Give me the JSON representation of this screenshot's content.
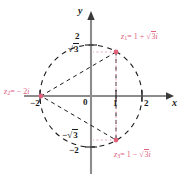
{
  "figure": {
    "type": "argand-diagram",
    "title": "",
    "axes": {
      "x_label": "x",
      "y_label": "y",
      "origin_label": "0",
      "x_ticks": [
        "-2",
        "1",
        "2"
      ],
      "y_ticks": [
        "2",
        "√3",
        "-√3",
        "-2"
      ]
    },
    "circle": {
      "radius_units": 2,
      "style": "dashed",
      "color": "#1a1a1a"
    },
    "points": [
      {
        "id": "z1",
        "label": "z₁ = 1 + √3i",
        "x": 1,
        "y": 1.732,
        "color": "#e0607e"
      },
      {
        "id": "z2",
        "label": "z₂ = −2i",
        "x": -2,
        "y": 0,
        "color": "#e0607e"
      },
      {
        "id": "z3",
        "label": "z₃ = 1 − √3i",
        "x": 1,
        "y": -1.732,
        "color": "#e0607e"
      }
    ],
    "labels": {
      "z1_prefix": "z",
      "z1_sub": "1",
      "z1_body": "= 1 + ",
      "z1_rad": "3",
      "z1_i": "i",
      "z2_prefix": "z",
      "z2_sub": "2",
      "z2_body": "= − 2",
      "z2_i": "i",
      "z3_prefix": "z",
      "z3_sub": "3",
      "z3_body": "= 1 − ",
      "z3_rad": "3",
      "z3_i": "i",
      "tick_2_top": "2",
      "tick_sqrt3_top": "3",
      "tick_sqrt3_bot": "3",
      "tick_2_bot": "2",
      "tick_minus2_x": "−2",
      "tick_1_x": "1",
      "tick_2_x": "2",
      "origin": "0",
      "axis_x": "x",
      "axis_y": "y"
    }
  },
  "chart_data": {
    "type": "scatter",
    "xlabel": "x",
    "ylabel": "y",
    "xlim": [
      -2.6,
      2.6
    ],
    "ylim": [
      -2.6,
      2.6
    ],
    "grid": false,
    "legend": "none",
    "x_ticks": [
      -2,
      0,
      1,
      2
    ],
    "x_ticklabels": [
      "-2",
      "0",
      "1",
      "2"
    ],
    "y_ticks": [
      -2,
      -1.732,
      1.732,
      2
    ],
    "y_ticklabels": [
      "-2",
      "-√3",
      "√3",
      "2"
    ],
    "series": [
      {
        "name": "roots",
        "color": "#e0607e",
        "points": [
          {
            "label": "z1",
            "x": 1,
            "y": 1.732,
            "annotation": "z₁ = 1 + √3i"
          },
          {
            "label": "z2",
            "x": -2,
            "y": 0,
            "annotation": "z₂ = −2i"
          },
          {
            "label": "z3",
            "x": 1,
            "y": -1.732,
            "annotation": "z₃ = 1 − √3i"
          }
        ]
      }
    ],
    "annotations": [
      {
        "kind": "circle",
        "center": [
          0,
          0
        ],
        "radius": 2,
        "style": "dashed"
      },
      {
        "kind": "polygon",
        "vertices": [
          [
            1,
            1.732
          ],
          [
            -2,
            0
          ],
          [
            1,
            -1.732
          ]
        ],
        "style": "dashed"
      },
      {
        "kind": "guideline",
        "from": [
          1,
          1.732
        ],
        "to": [
          1,
          0
        ],
        "style": "dotted"
      },
      {
        "kind": "guideline",
        "from": [
          1,
          1.732
        ],
        "to": [
          0,
          1.732
        ],
        "style": "dotted"
      },
      {
        "kind": "guideline",
        "from": [
          1,
          -1.732
        ],
        "to": [
          1,
          0
        ],
        "style": "dotted"
      },
      {
        "kind": "guideline",
        "from": [
          1,
          -1.732
        ],
        "to": [
          0,
          -1.732
        ],
        "style": "dotted"
      }
    ]
  }
}
